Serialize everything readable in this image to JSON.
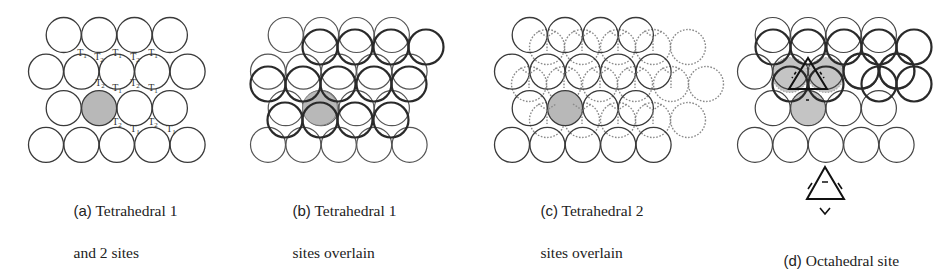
{
  "figure": {
    "colors": {
      "stroke_base": "#3a3a3a",
      "stroke_overlay": "#2a2a2a",
      "stroke_dotted": "#8a8a8a",
      "fill_highlight": "#b8b8b8",
      "fill_octa": "#c4c4c4",
      "background": "#ffffff"
    },
    "panels": [
      {
        "id": "a",
        "tag": "(a)",
        "caption_line1": " Tetrahedral 1",
        "caption_line2": "and 2 sites",
        "site_labels": [
          "T1",
          "T2",
          "T1",
          "T2",
          "T1",
          "T2",
          "T2",
          "T1",
          "T2",
          "T1",
          "T2",
          "T2",
          "T1",
          "T1"
        ]
      },
      {
        "id": "b",
        "tag": "(b)",
        "caption_line1": " Tetrahedral 1",
        "caption_line2": "sites overlain"
      },
      {
        "id": "c",
        "tag": "(c)",
        "caption_line1": " Tetrahedral 2",
        "caption_line2": "sites overlain"
      },
      {
        "id": "d",
        "tag": "(d)",
        "caption_line1": " Octahedral site",
        "caption_line2": ""
      }
    ]
  }
}
